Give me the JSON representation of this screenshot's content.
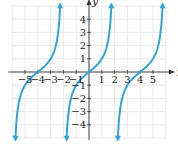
{
  "chart_data": {
    "type": "line",
    "title": "",
    "xlabel": "x",
    "ylabel": "y",
    "xlim": [
      -6,
      6
    ],
    "ylim": [
      -5,
      5
    ],
    "grid": true,
    "x_ticks": [
      -5,
      -4,
      -3,
      -2,
      -1,
      1,
      2,
      3,
      4,
      5
    ],
    "x_tick_labels": [
      "−5",
      "−4",
      "−3",
      "−2",
      "−1",
      "1",
      "2",
      "3",
      "4",
      "5"
    ],
    "y_ticks": [
      4,
      3,
      2,
      1,
      -1,
      -2,
      -3,
      -4
    ],
    "y_tick_labels": [
      "4",
      "3",
      "2",
      "1",
      "−1",
      "−2",
      "−3",
      "−4"
    ],
    "function": "y = tan(πx/4)",
    "period": 4,
    "branches": [
      {
        "name": "branch-left",
        "center_x": -4,
        "asymptotes": [
          -6,
          -2
        ]
      },
      {
        "name": "branch-middle",
        "center_x": 0,
        "asymptotes": [
          -2,
          2
        ]
      },
      {
        "name": "branch-right",
        "center_x": 4,
        "asymptotes": [
          2,
          6
        ]
      }
    ],
    "curve_color": "#2fa4d8",
    "grid_color": "#e2e2e2",
    "axis_color": "#333333"
  }
}
